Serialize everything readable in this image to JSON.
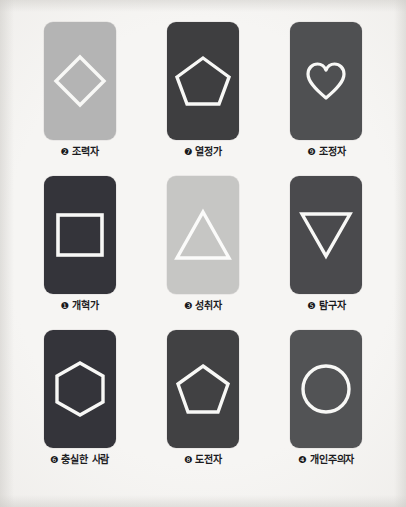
{
  "page": {
    "background_color": "#f2f1ef",
    "title_visible": false,
    "grid": {
      "rows": 3,
      "columns": 3
    }
  },
  "palette": {
    "light_gray": "#b4b4b4",
    "lighter_gray": "#c7c7c5",
    "dark_charcoal": "#3a3a3c",
    "medium_dark_gray": "#4f5052",
    "shape_outline": "#f7f7f5"
  },
  "cards": [
    {
      "position": "row1-col1",
      "number_glyph": "❷",
      "number": "2",
      "label": "조력자",
      "shape": "diamond-icon",
      "shape_name": "diamond",
      "card_color": "#b4b4b4",
      "outline_color": "#f8f8f6"
    },
    {
      "position": "row1-col2",
      "number_glyph": "❼",
      "number": "7",
      "label": "열정가",
      "shape": "pentagon-icon",
      "shape_name": "pentagon",
      "card_color": "#3e3e40",
      "outline_color": "#f8f8f6"
    },
    {
      "position": "row1-col3",
      "number_glyph": "❾",
      "number": "9",
      "label": "조정자",
      "shape": "heart-icon",
      "shape_name": "heart",
      "card_color": "#4f5052",
      "outline_color": "#f8f8f6"
    },
    {
      "position": "row2-col1",
      "number_glyph": "❶",
      "number": "1",
      "label": "개혁가",
      "shape": "square-icon",
      "shape_name": "square",
      "card_color": "#34343a",
      "outline_color": "#f8f8f6"
    },
    {
      "position": "row2-col2",
      "number_glyph": "❸",
      "number": "3",
      "label": "성취자",
      "shape": "triangle-up-icon",
      "shape_name": "triangle",
      "card_color": "#c6c6c4",
      "outline_color": "#fbfbfa"
    },
    {
      "position": "row2-col3",
      "number_glyph": "❺",
      "number": "5",
      "label": "탐구자",
      "shape": "triangle-down-icon",
      "shape_name": "inverted-triangle",
      "card_color": "#4a4a4d",
      "outline_color": "#f8f8f6"
    },
    {
      "position": "row3-col1",
      "number_glyph": "❻",
      "number": "6",
      "label": "충실한 사람",
      "shape": "hexagon-icon",
      "shape_name": "hexagon",
      "card_color": "#34343a",
      "outline_color": "#f8f8f6"
    },
    {
      "position": "row3-col2",
      "number_glyph": "❽",
      "number": "8",
      "label": "도전자",
      "shape": "pentagon-icon",
      "shape_name": "pentagon",
      "card_color": "#414143",
      "outline_color": "#f8f8f6"
    },
    {
      "position": "row3-col3",
      "number_glyph": "❹",
      "number": "4",
      "label": "개인주의자",
      "shape": "circle-icon",
      "shape_name": "circle",
      "card_color": "#525355",
      "outline_color": "#f8f8f6"
    }
  ]
}
